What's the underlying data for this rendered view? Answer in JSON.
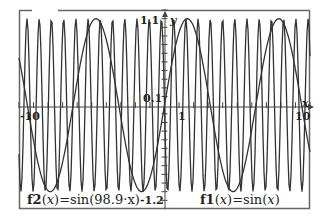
{
  "chart_data": {
    "type": "line",
    "title": "",
    "xlabel": "x",
    "ylabel": "y",
    "xlim": [
      -10,
      10
    ],
    "ylim": [
      -1.2,
      1.1
    ],
    "grid": false,
    "x_ticks_labeled": [
      "-10",
      "1",
      "10"
    ],
    "y_ticks_labeled": [
      "1.1",
      "0.1",
      "-1.2"
    ],
    "x_tick_step": 1,
    "y_tick_step": 0.1,
    "series": [
      {
        "name": "f1",
        "expression": "sin(x)",
        "label": "f1(x)=sin(x)",
        "color": "#333333"
      },
      {
        "name": "f2",
        "expression": "sin(98.9·x)",
        "label": "f2(x)=sin(98.9·x)",
        "color": "#333333"
      }
    ],
    "legend_position": "inline-bottom"
  },
  "labels": {
    "y_max": "1.1",
    "y_scale": "0.1",
    "y_min": "-1.2",
    "x_min": "-10",
    "x_scale": "1",
    "x_max": "10",
    "x_axis_name": "x",
    "y_axis_name": "y",
    "f1_name": "f1",
    "f1_arg": "x",
    "f1_rhs": "=sin",
    "f1_inner": "x",
    "f2_name": "f2",
    "f2_arg": "x",
    "f2_rhs": "=sin",
    "f2_inner": "98.9·x"
  },
  "colors": {
    "frame": "#555555",
    "curve": "#333333",
    "axis": "#444444",
    "background": "#ffffff"
  }
}
